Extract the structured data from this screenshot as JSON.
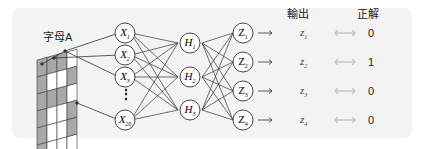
{
  "diagram": {
    "input_label": "字母A",
    "output_header": "輸出",
    "answer_header": "正解",
    "input_nodes": [
      {
        "name": "X",
        "sub": "1"
      },
      {
        "name": "X",
        "sub": "2"
      },
      {
        "name": "X",
        "sub": "3"
      },
      {
        "name": "X",
        "sub": "20"
      }
    ],
    "ellipsis": "⋮",
    "hidden_nodes": [
      {
        "name": "H",
        "sub": "1"
      },
      {
        "name": "H",
        "sub": "2"
      },
      {
        "name": "H",
        "sub": "3"
      }
    ],
    "output_nodes": [
      {
        "name": "Z",
        "sub": "1"
      },
      {
        "name": "Z",
        "sub": "2"
      },
      {
        "name": "Z",
        "sub": "3"
      },
      {
        "name": "Z",
        "sub": "4"
      }
    ],
    "outputs": [
      {
        "name": "z",
        "sub": "1",
        "answer": "0"
      },
      {
        "name": "z",
        "sub": "2",
        "answer": "1"
      },
      {
        "name": "z",
        "sub": "3",
        "answer": "0"
      },
      {
        "name": "z",
        "sub": "4",
        "answer": "0"
      }
    ],
    "colors": {
      "grid_gray": "#a8a8a8",
      "arrow_gray": "#c8c8c8",
      "line": "#333333"
    }
  }
}
